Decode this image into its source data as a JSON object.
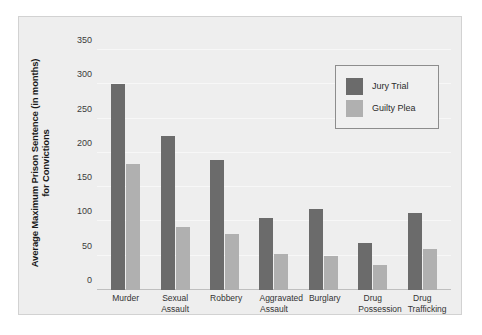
{
  "chart_data": {
    "type": "bar",
    "title": "",
    "xlabel": "",
    "ylabel": "Average Maximum Prison Sentence (in months) for Convictions",
    "ylabel_lines": [
      "Average Maximum Prison Sentence (in months)",
      "for Convictions"
    ],
    "categories": [
      "Murder",
      "Sexual Assault",
      "Robbery",
      "Aggravated Assault",
      "Burglary",
      "Drug Possession",
      "Drug Trafficking"
    ],
    "category_lines": [
      "Murder",
      "Sexual\nAssault",
      "Robbery",
      "Aggravated\nAssault",
      "Burglary",
      "Drug\nPossession",
      "Drug\nTrafficking"
    ],
    "series": [
      {
        "name": "Jury Trial",
        "color": "#6b6b6b",
        "values": [
          300,
          225,
          190,
          105,
          118,
          69,
          113
        ]
      },
      {
        "name": "Guilty Plea",
        "color": "#b0b0b0",
        "values": [
          184,
          92,
          82,
          53,
          49,
          36,
          60
        ]
      }
    ],
    "ylim": [
      0,
      350
    ],
    "yticks": [
      0,
      50,
      100,
      150,
      200,
      250,
      300,
      350
    ],
    "ytick_labels": [
      "0",
      "50",
      "100",
      "150",
      "200",
      "250",
      "300",
      "350"
    ],
    "grid": true,
    "legend_position": "upper-right",
    "panel_background": "#eeeeee",
    "legend_background": "#f0f0f0",
    "legend_border": "#8d8d8d"
  }
}
